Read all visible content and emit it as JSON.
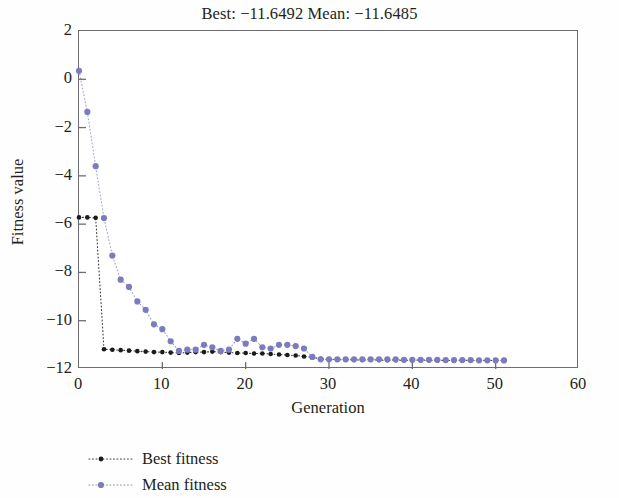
{
  "chart_data": {
    "type": "scatter",
    "title": "Best: −11.6492 Mean: −11.6485",
    "xlabel": "Generation",
    "ylabel": "Fitness value",
    "xlim": [
      0,
      60
    ],
    "ylim": [
      -12,
      2
    ],
    "xticks": [
      0,
      10,
      20,
      30,
      40,
      50,
      60
    ],
    "xtick_labels": [
      "0",
      "10",
      "20",
      "30",
      "40",
      "50",
      "60"
    ],
    "yticks": [
      2,
      0,
      -2,
      -4,
      -6,
      -8,
      -10,
      -12
    ],
    "ytick_labels": [
      "2",
      "0",
      "−2",
      "−4",
      "−6",
      "−8",
      "−10",
      "−12"
    ],
    "grid": false,
    "legend_position": "below-left",
    "x": [
      0,
      1,
      2,
      3,
      4,
      5,
      6,
      7,
      8,
      9,
      10,
      11,
      12,
      13,
      14,
      15,
      16,
      17,
      18,
      19,
      20,
      21,
      22,
      23,
      24,
      25,
      26,
      27,
      28,
      29,
      30,
      31,
      32,
      33,
      34,
      35,
      36,
      37,
      38,
      39,
      40,
      41,
      42,
      43,
      44,
      45,
      46,
      47,
      48,
      49,
      50,
      51
    ],
    "series": [
      {
        "name": "Best fitness",
        "color": "#1a1a1a",
        "marker": "dot",
        "linestyle": "dotted",
        "values": [
          -5.72,
          -5.72,
          -5.74,
          -11.18,
          -11.2,
          -11.22,
          -11.24,
          -11.26,
          -11.28,
          -11.3,
          -11.3,
          -11.32,
          -11.34,
          -11.32,
          -11.3,
          -11.3,
          -11.28,
          -11.3,
          -11.32,
          -11.34,
          -11.34,
          -11.36,
          -11.36,
          -11.38,
          -11.4,
          -11.42,
          -11.44,
          -11.48,
          -11.52,
          -11.58,
          -11.6,
          -11.61,
          -11.62,
          -11.62,
          -11.63,
          -11.63,
          -11.63,
          -11.64,
          -11.64,
          -11.64,
          -11.64,
          -11.64,
          -11.64,
          -11.645,
          -11.645,
          -11.645,
          -11.648,
          -11.648,
          -11.649,
          -11.649,
          -11.649,
          -11.6492
        ]
      },
      {
        "name": "Mean fitness",
        "color": "#7b7bc0",
        "marker": "dot",
        "linestyle": "dotted",
        "values": [
          0.35,
          -1.35,
          -3.6,
          -5.75,
          -7.3,
          -8.3,
          -8.6,
          -9.2,
          -9.55,
          -10.15,
          -10.35,
          -10.85,
          -11.25,
          -11.2,
          -11.2,
          -11.0,
          -11.1,
          -11.25,
          -11.2,
          -10.75,
          -10.95,
          -10.75,
          -11.1,
          -11.15,
          -11.0,
          -11.0,
          -11.05,
          -11.15,
          -11.5,
          -11.6,
          -11.6,
          -11.6,
          -11.6,
          -11.6,
          -11.6,
          -11.6,
          -11.6,
          -11.6,
          -11.6,
          -11.62,
          -11.62,
          -11.62,
          -11.62,
          -11.62,
          -11.63,
          -11.63,
          -11.63,
          -11.63,
          -11.64,
          -11.64,
          -11.64,
          -11.645
        ]
      }
    ],
    "legend": [
      {
        "label": "Best fitness",
        "color": "#1a1a1a"
      },
      {
        "label": "Mean fitness",
        "color": "#7b7bc0"
      }
    ]
  }
}
